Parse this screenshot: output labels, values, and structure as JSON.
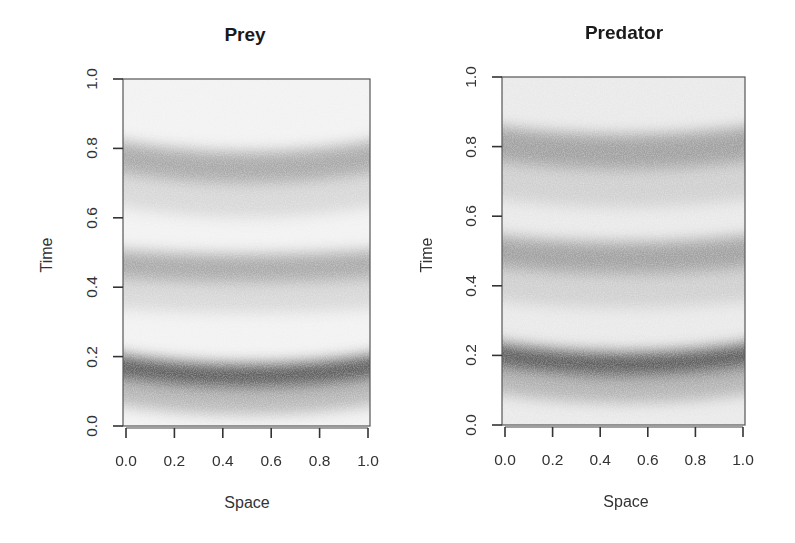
{
  "chart_data": [
    {
      "type": "heatmap",
      "title": "Prey",
      "xlabel": "Space",
      "ylabel": "Time",
      "xlim": [
        0.0,
        1.0
      ],
      "ylim": [
        0.0,
        1.0
      ],
      "xticks": [
        "0.0",
        "0.2",
        "0.4",
        "0.6",
        "0.8",
        "1.0"
      ],
      "yticks": [
        "0.0",
        "0.2",
        "0.4",
        "0.6",
        "0.8",
        "1.0"
      ],
      "grid": false,
      "colormap": "grayscale density (white = low, black = high)",
      "bands": [
        {
          "name": "wave 1",
          "time_at_edges": 0.18,
          "time_at_center": 0.145,
          "intensity": 0.85,
          "width": 0.035
        },
        {
          "name": "wave 2",
          "time_at_edges": 0.47,
          "time_at_center": 0.455,
          "intensity": 0.45,
          "width": 0.04
        },
        {
          "name": "wave 3",
          "time_at_edges": 0.785,
          "time_at_center": 0.745,
          "intensity": 0.45,
          "width": 0.045
        }
      ]
    },
    {
      "type": "heatmap",
      "title": "Predator",
      "xlabel": "Space",
      "ylabel": "Time",
      "xlim": [
        0.0,
        1.0
      ],
      "ylim": [
        0.0,
        1.0
      ],
      "xticks": [
        "0.0",
        "0.2",
        "0.4",
        "0.6",
        "0.8",
        "1.0"
      ],
      "yticks": [
        "0.0",
        "0.2",
        "0.4",
        "0.6",
        "0.8",
        "1.0"
      ],
      "grid": false,
      "colormap": "grayscale density (white = low, black = high)",
      "bands": [
        {
          "name": "wave 1",
          "time_at_edges": 0.21,
          "time_at_center": 0.175,
          "intensity": 0.85,
          "width": 0.035
        },
        {
          "name": "wave 2",
          "time_at_edges": 0.505,
          "time_at_center": 0.48,
          "intensity": 0.5,
          "width": 0.045
        },
        {
          "name": "wave 3",
          "time_at_edges": 0.815,
          "time_at_center": 0.785,
          "intensity": 0.5,
          "width": 0.05
        }
      ]
    }
  ],
  "panels": {
    "prey": {
      "title": "Prey",
      "xlabel": "Space",
      "ylabel": "Time"
    },
    "predator": {
      "title": "Predator",
      "xlabel": "Space",
      "ylabel": "Time"
    }
  }
}
